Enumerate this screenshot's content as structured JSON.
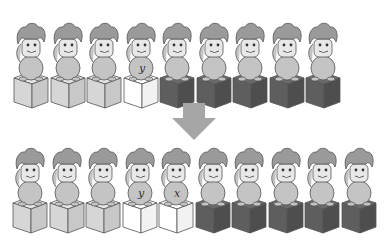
{
  "diagram": {
    "colors": {
      "cube_sorted": "#d6d6d6",
      "cube_key": "#ffffff",
      "cube_unsorted": "#5e5e5e",
      "arrow": "#a6a6a6",
      "figure_fill": "#c4c4c4",
      "hair_fill": "#9a9a9a",
      "outline": "#555555"
    },
    "top_row": {
      "label": "before",
      "units": [
        {
          "cube": "sorted",
          "letter": ""
        },
        {
          "cube": "sorted",
          "letter": ""
        },
        {
          "cube": "sorted",
          "letter": ""
        },
        {
          "cube": "key",
          "letter": "y"
        },
        {
          "cube": "unsorted",
          "letter": ""
        },
        {
          "cube": "unsorted",
          "letter": ""
        },
        {
          "cube": "unsorted",
          "letter": ""
        },
        {
          "cube": "unsorted",
          "letter": ""
        },
        {
          "cube": "unsorted",
          "letter": ""
        }
      ]
    },
    "arrow": {
      "icon": "down-arrow-icon",
      "direction": "down"
    },
    "bottom_row": {
      "label": "after",
      "units": [
        {
          "cube": "sorted",
          "letter": ""
        },
        {
          "cube": "sorted",
          "letter": ""
        },
        {
          "cube": "sorted",
          "letter": ""
        },
        {
          "cube": "key",
          "letter": "y"
        },
        {
          "cube": "key",
          "letter": "x"
        },
        {
          "cube": "unsorted",
          "letter": ""
        },
        {
          "cube": "unsorted",
          "letter": ""
        },
        {
          "cube": "unsorted",
          "letter": ""
        },
        {
          "cube": "unsorted",
          "letter": ""
        },
        {
          "cube": "unsorted",
          "letter": ""
        }
      ]
    }
  }
}
